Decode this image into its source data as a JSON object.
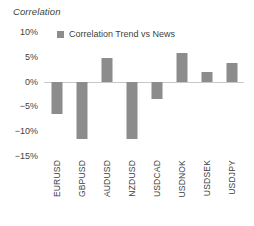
{
  "chart_data": {
    "type": "bar",
    "title": "Correlation",
    "xlabel": "",
    "ylabel": "",
    "ylim": [
      -15,
      10
    ],
    "ytick_step": 5,
    "ytick_labels": [
      "10%",
      "5%",
      "0%",
      "−5%",
      "−10%",
      "−15%"
    ],
    "ytick_values": [
      10,
      5,
      0,
      -5,
      -10,
      -15
    ],
    "grid": false,
    "legend_position": "top-left-inside",
    "categories": [
      "EURUSD",
      "GBPUSD",
      "AUDUSD",
      "NZDUSD",
      "USDCAD",
      "USDNOK",
      "USDSEK",
      "USDJPY"
    ],
    "series": [
      {
        "name": "Correlation Trend vs News",
        "color": "#8c8c8c",
        "values": [
          -6.5,
          -11.5,
          4.8,
          -11.5,
          -3.5,
          5.8,
          2.0,
          3.7
        ]
      }
    ]
  },
  "legend": {
    "items": [
      {
        "label": "Correlation Trend vs News",
        "color": "#8c8c8c"
      }
    ]
  },
  "colors": {
    "bar": "#8c8c8c",
    "axis_line": "#c8c8c8",
    "text": "#3f3f3f",
    "background": "#ffffff"
  }
}
